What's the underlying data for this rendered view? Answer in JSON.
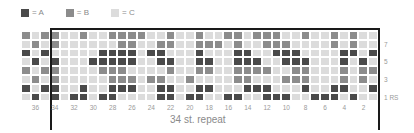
{
  "chart_data": {
    "type": "heatmap",
    "legend": [
      {
        "key": "A",
        "label": "= A",
        "color": "#4a4a4a"
      },
      {
        "key": "B",
        "label": "= B",
        "color": "#8c8c8c"
      },
      {
        "key": "C",
        "label": "= C",
        "color": "#dcdcdc"
      }
    ],
    "columns": [
      37,
      36,
      35,
      34,
      33,
      32,
      31,
      30,
      29,
      28,
      27,
      26,
      25,
      24,
      23,
      22,
      21,
      20,
      19,
      18,
      17,
      16,
      15,
      14,
      13,
      12,
      11,
      10,
      9,
      8,
      7,
      6,
      5,
      4,
      3,
      2,
      1
    ],
    "column_tick_labels": [
      "36",
      "34",
      "32",
      "30",
      "28",
      "26",
      "24",
      "22",
      "20",
      "18",
      "16",
      "14",
      "12",
      "10",
      "8",
      "6",
      "4",
      "2"
    ],
    "row_tick_labels": [
      "7",
      "5",
      "3",
      "1 RS"
    ],
    "repeat_label": "34 st. repeat",
    "rows": [
      {
        "row": 8,
        "cells": "BCBBCCBCCBBBBCCBCCBCCBBCBBBCCBCCBCB"
      },
      {
        "row": 7,
        "cells": "CBCBCCCCCCBBCCBBCCBBBCBCCBBBCCCCBCBCC"
      },
      {
        "row": 6,
        "cells": "ACACCCCCAAAACAACCCACCCAACCAAACCCCAACA"
      },
      {
        "row": 5,
        "cells": "CACACCCAAAAACCAACCAACCAAACCAAACCCACAC"
      },
      {
        "row": 4,
        "cells": "BCBBCCCCBBBCCCCBCCBBCCBBBBCCBBCCCBCBB"
      },
      {
        "row": 3,
        "cells": "CBCBCCCCCBBBCBBCCBCCCCBBCCCBBBCCCBCBC"
      },
      {
        "row": 2,
        "cells": "ACAACCACCAAACCAACCAACCCAAACCCACCAACCA"
      },
      {
        "row": 1,
        "cells": "CACACAACAACCCCAACAACCAACCAAACCAAACACC"
      }
    ]
  }
}
